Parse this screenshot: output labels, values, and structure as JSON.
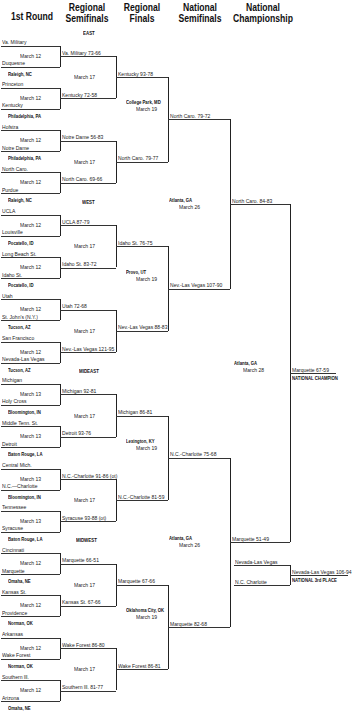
{
  "headers": {
    "first_round": "1st Round",
    "regional_semifinals": "Regional Semifinals",
    "regional_finals": "Regional Finals",
    "national_semifinals": "National Semifinals",
    "national_championship": "National Championship"
  },
  "regions": {
    "east": "EAST",
    "west": "WEST",
    "mideast": "MIDEAST",
    "midwest": "MIDWEST"
  },
  "first_round": {
    "teams": [
      "Va. Military",
      "Duquesne",
      "Princeton",
      "Kentucky",
      "Hofstra",
      "Notre Dame",
      "North Caro.",
      "Purdue",
      "UCLA",
      "Louisville",
      "Long Beach St.",
      "Idaho St.",
      "Utah",
      "St. John's (N.Y.)",
      "San Francisco",
      "Nevada-Las Vegas",
      "Michigan",
      "Holy Cross",
      "Middle Tenn. St.",
      "Detroit",
      "Central Mich.",
      "N.C.—Charlotte",
      "Tennessee",
      "Syracuse",
      "Cincinnati",
      "Marquette",
      "Kansas St.",
      "Providence",
      "Arkansas",
      "Wake Forest",
      "Southern Ill.",
      "Arizona"
    ],
    "dates": [
      "March 12",
      "March 12",
      "March 12",
      "March 12",
      "March 12",
      "March 12",
      "March 12",
      "March 12",
      "March 13",
      "March 13",
      "March 13",
      "March 13",
      "March 12",
      "March 12",
      "March 12",
      "March 12"
    ],
    "locations": [
      "Raleigh, NC",
      "Philadelphia, PA",
      "Philadelphia, PA",
      "Raleigh, NC",
      "Pocatello, ID",
      "Pocatello, ID",
      "Tucson, AZ",
      "Tucson, AZ",
      "Bloomington, IN",
      "Baton Rouge, LA",
      "Bloomington, IN",
      "Baton Rouge, LA",
      "Omaha, NE",
      "Norman, OK",
      "Norman, OK",
      "Omaha, NE"
    ]
  },
  "regional_semifinals": {
    "results": [
      "Va. Military 73-66",
      "Kentucky 72-58",
      "Notre Dame 56-83",
      "North Caro. 69-66",
      "UCLA 87-79",
      "Idaho St. 83-72",
      "Utah 72-68",
      "Nev.-Las Vegas 121-95",
      "Michigan 92-81",
      "Detroit 93-76",
      "N.C.-Charlotte 91-86 (ot)",
      "Syracuse 93-88 (ot)",
      "Marquette 66-51",
      "Kansas St. 67-66",
      "Wake Forest 86-80",
      "Southern Ill. 81-77"
    ],
    "date": "March 17"
  },
  "regional_finals": {
    "results": [
      "Kentucky 93-78",
      "North Caro. 79-77",
      "Idaho St. 76-75",
      "Nev.-Las Vegas 88-83",
      "Michigan 86-81",
      "N.C.-Charlotte 81-59",
      "Marquette 67-66",
      "Wake Forest 86-81"
    ],
    "locations": [
      "College Park, MD",
      "Provo, UT",
      "Lexington, KY",
      "Oklahoma City, OK"
    ],
    "date": "March 19"
  },
  "national_semifinals": {
    "results": [
      "North Caro. 79-72",
      "Nev.-Las Vegas 107-90",
      "N.C.-Charlotte 75-68",
      "Marquette 82-68"
    ],
    "locations": [
      "Atlanta, GA",
      "Atlanta, GA"
    ],
    "date": "March 26"
  },
  "national_championship": {
    "results": [
      "North Caro. 84-83",
      "Marquette 51-49"
    ],
    "location": "Atlanta, GA",
    "date": "March 28",
    "champion_result": "Marquette 67-59",
    "champion_label": "NATIONAL CHAMPION"
  },
  "third_place": {
    "teams": [
      "Nevada-Las Vegas",
      "N.C. Charlotte"
    ],
    "result": "Nevada-Las Vegas 106-94",
    "label": "NATIONAL 3rd PLACE"
  }
}
